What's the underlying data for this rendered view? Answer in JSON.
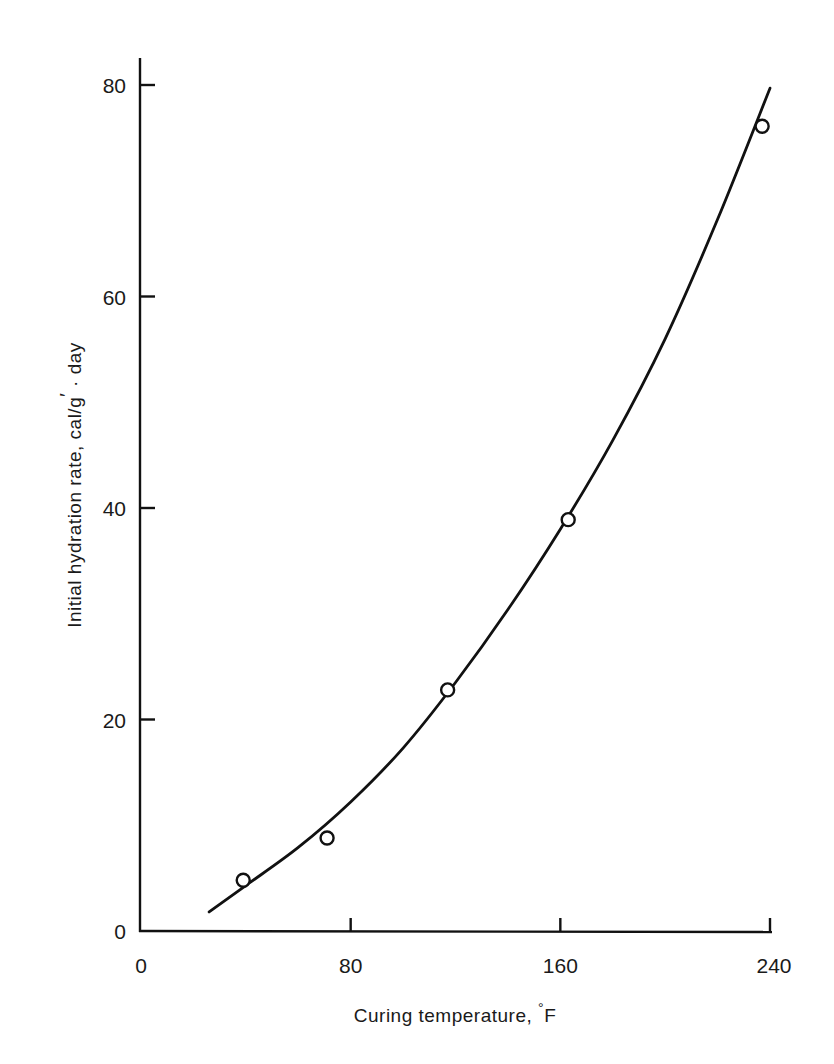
{
  "chart_data": {
    "type": "scatter",
    "title": "",
    "xlabel": "Curing temperature, °F",
    "ylabel": "Initial hydration rate, cal/g · day",
    "xlim": [
      0,
      240
    ],
    "ylim": [
      0,
      80
    ],
    "x_ticks": [
      0,
      80,
      160,
      240
    ],
    "y_ticks": [
      0,
      20,
      40,
      60,
      80
    ],
    "grid": false,
    "legend": null,
    "series": [
      {
        "name": "Measured",
        "marker": "open-circle",
        "x": [
          39,
          71,
          117,
          163,
          237
        ],
        "y": [
          4.8,
          8.8,
          22.8,
          38.9,
          76.1
        ]
      },
      {
        "name": "Fitted curve",
        "style": "line",
        "x": [
          26,
          40,
          60,
          80,
          100,
          120,
          140,
          160,
          180,
          200,
          220,
          240
        ],
        "y": [
          1.8,
          4.3,
          7.9,
          12.2,
          17.3,
          23.5,
          30.4,
          38.0,
          46.4,
          56.0,
          67.3,
          79.7
        ]
      }
    ]
  },
  "labels": {
    "x_tick_labels": [
      "0",
      "80",
      "160",
      "240"
    ],
    "y_tick_labels": [
      "0",
      "20",
      "40",
      "60",
      "80"
    ],
    "xlabel_text": "Curing temperature, ",
    "xlabel_unit_degree": "°",
    "xlabel_unit": "F",
    "ylabel_text": "Initial hydration rate, cal/g",
    "ylabel_prime": "′",
    "ylabel_rest": " · day"
  }
}
